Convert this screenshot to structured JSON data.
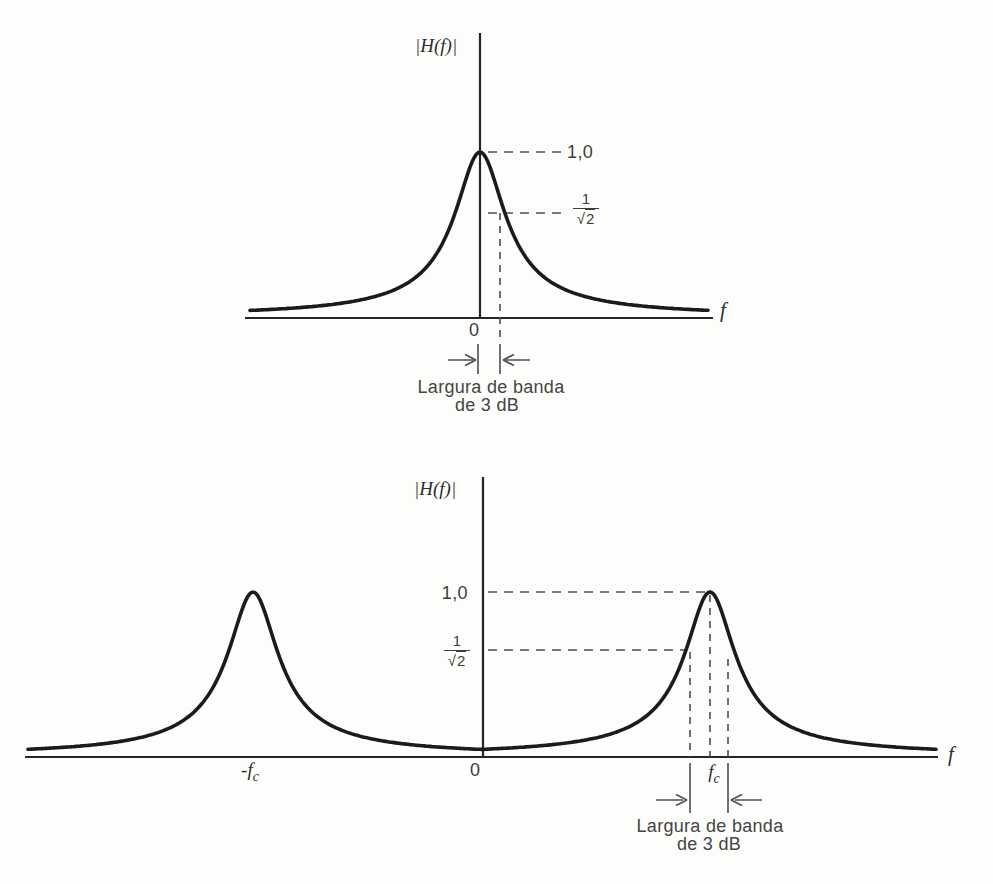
{
  "figure": {
    "colors": {
      "background": "#fdfdfc",
      "curve_ink": "#1b1b19",
      "axis_ink": "#252523",
      "dash_ink": "#4d4d4b",
      "text_ink": "#3d3d3b"
    }
  },
  "lowpass": {
    "y_axis_label": "|H(f)|",
    "x_axis_label": "f",
    "origin": "0",
    "peak_value": "1,0",
    "half_power_num": "1",
    "half_power_sqrt": "√",
    "half_power_rad": "2",
    "bw_line1": "Largura de banda",
    "bw_line2": "de 3 dB"
  },
  "bandpass": {
    "y_axis_label": "|H(f)|",
    "x_axis_label": "f",
    "origin": "0",
    "peak_value": "1,0",
    "half_power_num": "1",
    "half_power_sqrt": "√",
    "half_power_rad": "2",
    "neg_fc_main": "-f",
    "neg_fc_sub": "c",
    "fc_main": "f",
    "fc_sub": "c",
    "bw_line1": "Largura de banda",
    "bw_line2": "de 3 dB"
  },
  "chart_data": [
    {
      "type": "line",
      "xlabel": "f",
      "ylabel": "|H(f)|",
      "x_ticks": [
        "0"
      ],
      "ylim": [
        0,
        1.0
      ],
      "grid": false,
      "annotations": [
        "1,0",
        "1/√2",
        "Largura de banda de 3 dB"
      ],
      "series": [
        {
          "name": "lowpass-magnitude-response",
          "description": "Schematic lowpass amplitude response: single resonant-style peak centered at f = 0; dashed guides mark the peak level 1,0 and the half-power level 1/√2; the 3 dB bandwidth is marked between f = 0 and the half-power frequency.",
          "key_points": [
            {
              "f": "0",
              "H": 1.0
            },
            {
              "f": "B/2 (3 dB point)",
              "H": 0.707
            },
            {
              "f": "±∞",
              "H": 0.0
            }
          ]
        }
      ]
    },
    {
      "type": "line",
      "xlabel": "f",
      "ylabel": "|H(f)|",
      "x_ticks": [
        "-fc",
        "0",
        "fc"
      ],
      "ylim": [
        0,
        1.0
      ],
      "grid": false,
      "annotations": [
        "1,0",
        "1/√2",
        "Largura de banda de 3 dB"
      ],
      "series": [
        {
          "name": "bandpass-magnitude-response",
          "description": "Schematic bandpass amplitude response: identical resonant peaks at f = -fc and f = +fc, dipping to ≈0 at f = 0; dashed guides on the +fc peak mark the peak level 1,0 and the half-power level 1/√2; the 3 dB bandwidth is marked symmetrically about fc.",
          "key_points": [
            {
              "f": "-fc",
              "H": 1.0
            },
            {
              "f": "0",
              "H": 0.0
            },
            {
              "f": "fc - B/2 (3 dB point)",
              "H": 0.707
            },
            {
              "f": "fc",
              "H": 1.0
            },
            {
              "f": "fc + B/2 (3 dB point)",
              "H": 0.707
            }
          ]
        }
      ]
    }
  ]
}
